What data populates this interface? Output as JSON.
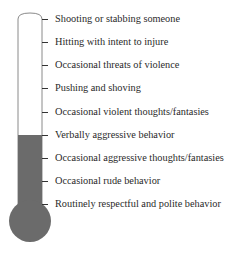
{
  "diagram": {
    "type": "thermometer-scale",
    "fill_color": "#6b6b6b",
    "outline_color": "#8a8a8a",
    "fill_level_label_index": 5,
    "levels": [
      {
        "label": "Shooting or stabbing someone"
      },
      {
        "label": "Hitting with intent to injure"
      },
      {
        "label": "Occasional threats of violence"
      },
      {
        "label": "Pushing and shoving"
      },
      {
        "label": "Occasional violent thoughts/fantasies"
      },
      {
        "label": "Verbally aggressive behavior"
      },
      {
        "label": "Occasional aggressive thoughts/fantasies"
      },
      {
        "label": "Occasional rude behavior"
      },
      {
        "label": "Routinely respectful and polite behavior"
      }
    ]
  }
}
